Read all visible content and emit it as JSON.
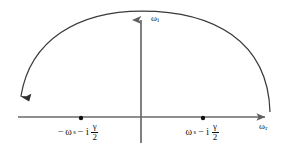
{
  "figure": {
    "title": "",
    "background_color": "#ffffff",
    "axis_color": "#6a6a6a",
    "curve_color": "#3a3a3a",
    "text_color": "#111111",
    "width": 284,
    "height": 149
  },
  "axes": {
    "real": {
      "label_omega": "ω",
      "label_sub": "r",
      "name": "omega-real-axis",
      "x_start": 18,
      "x_end": 272,
      "y": 117,
      "arrow": "right"
    },
    "imag": {
      "label_omega": "ω",
      "label_sub": "i",
      "name": "omega-imaginary-axis",
      "x": 141,
      "y_start": 13,
      "y_end": 143,
      "arrow": "up"
    }
  },
  "contour": {
    "name": "semicircular-contour",
    "description": "semicircular arc traversed clockwise, arrowhead at lower-left end",
    "arrow_direction": "down-left",
    "apex_y": 11,
    "left_end": [
      20,
      100
    ],
    "right_end": [
      270,
      112
    ]
  },
  "poles": [
    {
      "name": "pole-left",
      "x": 81,
      "y": 118,
      "label": {
        "sign": "−",
        "omega": "ω",
        "sub": "s",
        "operator": "−",
        "imaginary_unit": "i",
        "fraction_num": "γ",
        "fraction_den": "2",
        "full_text": "−ωₛ − i γ/2"
      }
    },
    {
      "name": "pole-right",
      "x": 203,
      "y": 118,
      "label": {
        "sign": "",
        "omega": "ω",
        "sub": "s",
        "operator": "−",
        "imaginary_unit": "i",
        "fraction_num": "γ",
        "fraction_den": "2",
        "full_text": "ωₛ − i γ/2"
      }
    }
  ]
}
